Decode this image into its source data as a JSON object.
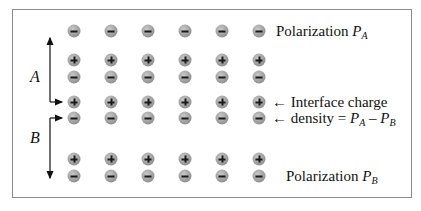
{
  "figure": {
    "labels": {
      "polarization_a_text": "Polarization ",
      "polarization_a_symbol": "P",
      "polarization_a_sub": "A",
      "polarization_b_text": "Polarization ",
      "polarization_b_symbol": "P",
      "polarization_b_sub": "B",
      "interface_line1": "← Interface charge",
      "interface_line2_prefix": "← density = ",
      "interface_p1": "P",
      "interface_p1_sub": "A",
      "interface_minus": " – ",
      "interface_p2": "P",
      "interface_p2_sub": "B",
      "region_a": "A",
      "region_b": "B"
    },
    "columns_x": [
      74,
      111,
      148,
      185,
      222,
      259
    ],
    "rows": [
      {
        "y": 31,
        "charge": "minus"
      },
      {
        "y": 60,
        "charge": "plus"
      },
      {
        "y": 77,
        "charge": "minus"
      },
      {
        "y": 102,
        "charge": "plus"
      },
      {
        "y": 118,
        "charge": "minus"
      },
      {
        "y": 159,
        "charge": "plus"
      },
      {
        "y": 176,
        "charge": "minus"
      }
    ],
    "colors": {
      "ion_fill": "#9a9a9a",
      "ion_sign": "#1a1a1a",
      "border": "#8a8a8a",
      "text": "#111111"
    }
  }
}
